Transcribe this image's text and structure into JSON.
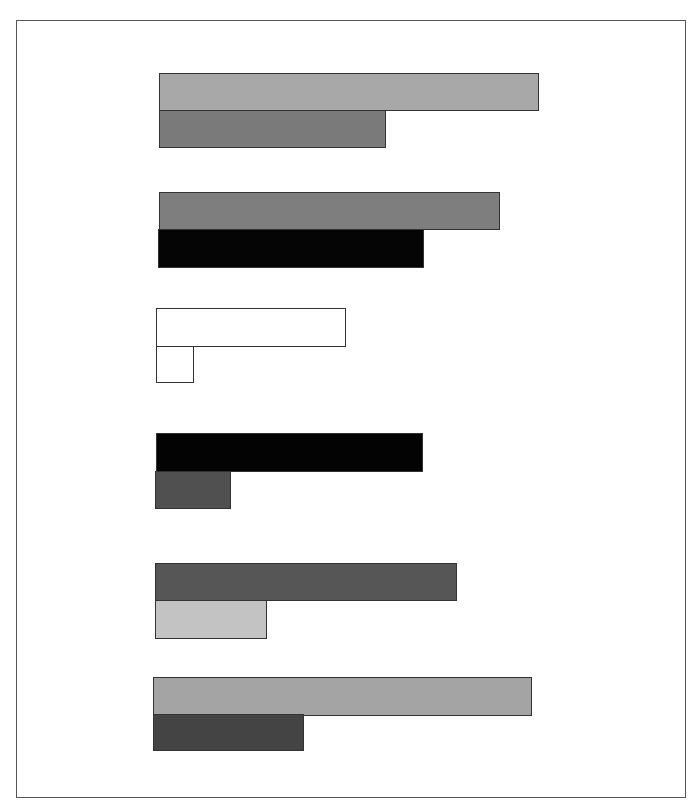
{
  "chart_data": {
    "type": "bar",
    "orientation": "horizontal",
    "title": "",
    "xlabel": "",
    "ylabel": "",
    "grid": false,
    "legend": null,
    "baseline_px": 155,
    "units": "pixel length from baseline (no axis labels shown)",
    "categories": [
      "Group 1",
      "Group 2",
      "Group 3",
      "Group 4",
      "Group 5",
      "Group 6"
    ],
    "groups": [
      {
        "top": {
          "start": 159,
          "end": 539,
          "y": 73,
          "h": 38,
          "color": "#a8a8a8",
          "value": 380
        },
        "bottom": {
          "start": 159,
          "end": 386,
          "y": 110,
          "h": 38,
          "color": "#7a7a7a",
          "value": 227
        }
      },
      {
        "top": {
          "start": 159,
          "end": 500,
          "y": 192,
          "h": 38,
          "color": "#7e7e7e",
          "value": 341
        },
        "bottom": {
          "start": 158,
          "end": 424,
          "y": 229,
          "h": 39,
          "color": "#050505",
          "value": 266
        }
      },
      {
        "top": {
          "start": 156,
          "end": 346,
          "y": 308,
          "h": 39,
          "color": "#ffffff",
          "value": 190
        },
        "bottom": {
          "start": 156,
          "end": 194,
          "y": 346,
          "h": 37,
          "color": "#ffffff",
          "value": 38
        }
      },
      {
        "top": {
          "start": 156,
          "end": 423,
          "y": 433,
          "h": 39,
          "color": "#030303",
          "value": 267
        },
        "bottom": {
          "start": 155,
          "end": 231,
          "y": 471,
          "h": 38,
          "color": "#505050",
          "value": 76
        }
      },
      {
        "top": {
          "start": 155,
          "end": 457,
          "y": 563,
          "h": 38,
          "color": "#565656",
          "value": 302
        },
        "bottom": {
          "start": 155,
          "end": 267,
          "y": 600,
          "h": 39,
          "color": "#c3c3c3",
          "value": 112
        }
      },
      {
        "top": {
          "start": 153,
          "end": 532,
          "y": 677,
          "h": 39,
          "color": "#a4a4a4",
          "value": 379
        },
        "bottom": {
          "start": 153,
          "end": 304,
          "y": 714,
          "h": 37,
          "color": "#444444",
          "value": 151
        }
      }
    ],
    "series": [
      {
        "name": "top bar",
        "values": [
          380,
          341,
          190,
          267,
          302,
          379
        ]
      },
      {
        "name": "bottom bar",
        "values": [
          227,
          266,
          38,
          76,
          112,
          151
        ]
      }
    ]
  },
  "frame": {
    "left": 16,
    "top": 20,
    "width": 670,
    "height": 778,
    "border_color": "#555555"
  }
}
